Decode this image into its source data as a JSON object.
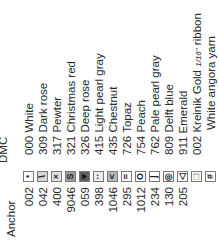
{
  "headers": {
    "anchor": "Anchor",
    "dmc": "DMC"
  },
  "rows": [
    {
      "anchor": "002",
      "symbol": "•",
      "symbol_name": "dot",
      "fill": "#ffffff",
      "dmc": "000 White"
    },
    {
      "anchor": "042",
      "symbol": "\\",
      "symbol_name": "backslash",
      "fill": "#d6d6d6",
      "dmc": "309 Dark rose"
    },
    {
      "anchor": "400",
      "symbol": "×",
      "symbol_name": "cross",
      "fill": "#e2e2e2",
      "dmc": "317 Pewter"
    },
    {
      "anchor": "9046",
      "symbol": "S",
      "symbol_name": "s-curve",
      "fill": "#9c9c9c",
      "dmc": "321 Christmas red"
    },
    {
      "anchor": "059",
      "symbol": "♥",
      "symbol_name": "heart",
      "fill": "#5e5e5e",
      "dmc": "326 Deep rose"
    },
    {
      "anchor": "398",
      "symbol": "··",
      "symbol_name": "two-dots",
      "fill": "#ececec",
      "dmc": "415 Light pearl gray"
    },
    {
      "anchor": "1046",
      "symbol": "<",
      "symbol_name": "less-than",
      "fill": "#b8b8b8",
      "dmc": "435 Chestnut"
    },
    {
      "anchor": "295",
      "symbol": "=",
      "symbol_name": "equals",
      "fill": "#ffffff",
      "dmc": "726 Topaz"
    },
    {
      "anchor": "1012",
      "symbol": "O",
      "symbol_name": "ring",
      "fill": "#ffffff",
      "dmc": "754 Peach"
    },
    {
      "anchor": "234",
      "symbol": "⌋",
      "symbol_name": "corner",
      "fill": "#ffffff",
      "dmc": "762 Pale pearl gray"
    },
    {
      "anchor": "130",
      "symbol": "◎",
      "symbol_name": "bullseye",
      "fill": "#ffffff",
      "dmc": "809 Delft blue"
    },
    {
      "anchor": "205",
      "symbol": "◁",
      "symbol_name": "triangle-left",
      "fill": "#ffffff",
      "dmc": "911 Emerald"
    },
    {
      "anchor": "",
      "symbol": "□",
      "symbol_name": "square",
      "fill": "#ffffff",
      "dmc": "002 Kreinik Gold",
      "dmc_fraction": "1/16\"",
      "dmc_suffix": " ribbon"
    },
    {
      "anchor": "",
      "symbol": "#",
      "symbol_name": "hash",
      "fill": "#ffffff",
      "dmc": "",
      "dmc_continued": "White angora yarn"
    }
  ]
}
